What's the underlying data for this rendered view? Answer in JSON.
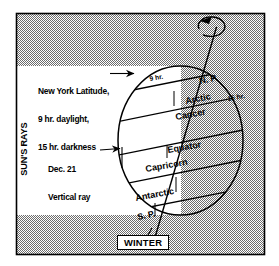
{
  "figure": {
    "frame": {
      "border_color": "#000000",
      "shade_color": "#a8a8a8",
      "day_color": "#ffffff"
    }
  },
  "annotations": {
    "new_york": {
      "line1": "New York Latitude,",
      "line2": "9 hr. daylight,",
      "line3": "15 hr. darkness"
    },
    "dec21": {
      "line1": "Dec. 21",
      "line2": "Vertical ray"
    },
    "suns_rays": "SUN'S RAYS",
    "winter": "WINTER"
  },
  "globe_labels": {
    "north_pole": "N. P.",
    "south_pole": "S. P.",
    "arctic": "Arctic",
    "cancer": "Cancer",
    "equator": "Equator",
    "capricorn": "Capricorn",
    "antarctic": "Antarctic",
    "hours_day": "9 hr.",
    "hours_night": "15 hr."
  }
}
